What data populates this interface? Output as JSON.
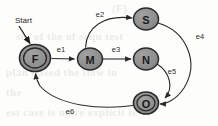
{
  "diagram": {
    "type": "state-transition-diagram",
    "title": "Start",
    "background_color": "#fdfdfc",
    "node_fill_color": "#8f8f8f",
    "node_stroke_color": "#2a2a2a",
    "edge_color": "#2a2a2a",
    "start_marker": {
      "label": "Start",
      "target_node": "F"
    },
    "nodes": [
      {
        "id": "F",
        "label": "F",
        "shape": "doublecircle",
        "cx": 35,
        "cy": 58,
        "rx": 15.5,
        "ry": 13.5
      },
      {
        "id": "M",
        "label": "M",
        "shape": "circle",
        "cx": 90,
        "cy": 59,
        "rx": 12.5,
        "ry": 11.0
      },
      {
        "id": "S",
        "label": "S",
        "shape": "circle",
        "cx": 146,
        "cy": 19,
        "rx": 12.5,
        "ry": 11.0
      },
      {
        "id": "N",
        "label": "N",
        "shape": "circle",
        "cx": 146,
        "cy": 59,
        "rx": 12.5,
        "ry": 11.0
      },
      {
        "id": "O",
        "label": "O",
        "shape": "doublecircle",
        "cx": 146,
        "cy": 103,
        "rx": 12.5,
        "ry": 11.0
      }
    ],
    "edges": [
      {
        "id": "e1",
        "label": "e1",
        "from": "F",
        "to": "M",
        "label_x": 61,
        "label_y": 49
      },
      {
        "id": "e2",
        "label": "e2",
        "from": "M",
        "to": "S",
        "label_x": 100,
        "label_y": 14
      },
      {
        "id": "e3",
        "label": "e3",
        "from": "M",
        "to": "N",
        "label_x": 116,
        "label_y": 49
      },
      {
        "id": "e4",
        "label": "e4",
        "from": "S",
        "to": "O",
        "label_x": 200,
        "label_y": 36
      },
      {
        "id": "e5",
        "label": "e5",
        "from": "N",
        "to": "O",
        "label_x": 172,
        "label_y": 71
      },
      {
        "id": "e6",
        "label": "e6",
        "from": "O",
        "to": "F",
        "label_x": 70,
        "label_y": 111
      }
    ],
    "ghost_text": {
      "line1": "(F)",
      "line2": "ses of the of sequ test",
      "line3": "plan based the flow in",
      "line4": "the",
      "line5": "est case is more explicit is"
    }
  }
}
